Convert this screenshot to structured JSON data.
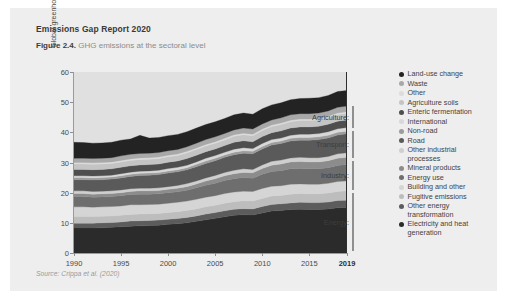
{
  "card": {
    "report_title": "Emissions Gap Report 2020",
    "figure_number": "Figure 2.4.",
    "figure_caption": "GHG emissions at the sectoral level",
    "source": "Source: Crippa et al. (2020)"
  },
  "chart_data": {
    "type": "area",
    "title": "GHG emissions at the sectoral level",
    "xlabel": "",
    "ylabel": "Global greenhouse gas emissions (GtCO₂e)",
    "xlim": [
      1990,
      2019
    ],
    "ylim": [
      0,
      60
    ],
    "ytick_labels": [
      "0",
      "10",
      "20",
      "30",
      "40",
      "50",
      "60"
    ],
    "ytick_values": [
      0,
      10,
      20,
      30,
      40,
      50,
      60
    ],
    "xtick_labels": [
      "1990",
      "1995",
      "2000",
      "2005",
      "2010",
      "2015",
      "2019"
    ],
    "xtick_values": [
      1990,
      1995,
      2000,
      2005,
      2010,
      2015,
      2019
    ],
    "xtick_bold": [
      "2019"
    ],
    "grid": false,
    "legend_position": "right",
    "stack_order_bottom_to_top": [
      "Electricity and heat generation",
      "Other energy transformation",
      "Fugitive emissions",
      "Building and other",
      "Energy use",
      "Mineral products",
      "Other industrial processes",
      "Road",
      "Non-road",
      "International",
      "Enteric fermentation",
      "Agriculture soils",
      "Other",
      "Waste",
      "Land-use change"
    ],
    "x": [
      1990,
      1991,
      1992,
      1993,
      1994,
      1995,
      1996,
      1997,
      1998,
      1999,
      2000,
      2001,
      2002,
      2003,
      2004,
      2005,
      2006,
      2007,
      2008,
      2009,
      2010,
      2011,
      2012,
      2013,
      2014,
      2015,
      2016,
      2017,
      2018,
      2019
    ],
    "series": [
      {
        "name": "Electricity and heat generation",
        "color": "#2b2b2b",
        "values": [
          8.3,
          8.3,
          8.3,
          8.4,
          8.5,
          8.7,
          8.9,
          9.0,
          9.1,
          9.2,
          9.5,
          9.7,
          10.0,
          10.5,
          11.0,
          11.5,
          12.0,
          12.5,
          12.7,
          12.6,
          13.3,
          13.9,
          14.1,
          14.4,
          14.5,
          14.4,
          14.4,
          14.6,
          15.0,
          15.1
        ]
      },
      {
        "name": "Other energy transformation",
        "color": "#5c5c5c",
        "values": [
          1.6,
          1.6,
          1.6,
          1.6,
          1.6,
          1.6,
          1.7,
          1.7,
          1.7,
          1.7,
          1.7,
          1.7,
          1.8,
          1.8,
          1.9,
          1.9,
          2.0,
          2.0,
          2.0,
          2.0,
          2.1,
          2.2,
          2.2,
          2.2,
          2.3,
          2.3,
          2.3,
          2.3,
          2.4,
          2.4
        ]
      },
      {
        "name": "Fugitive emissions",
        "color": "#bdbdbd",
        "values": [
          2.2,
          2.2,
          2.2,
          2.2,
          2.2,
          2.2,
          2.2,
          2.2,
          2.2,
          2.2,
          2.2,
          2.3,
          2.3,
          2.3,
          2.4,
          2.4,
          2.5,
          2.5,
          2.6,
          2.6,
          2.7,
          2.8,
          2.8,
          2.9,
          2.9,
          2.9,
          2.9,
          3.0,
          3.0,
          3.1
        ]
      },
      {
        "name": "Building and other",
        "color": "#d5d5d5",
        "values": [
          3.2,
          3.2,
          3.1,
          3.1,
          3.1,
          3.1,
          3.2,
          3.1,
          3.1,
          3.1,
          3.1,
          3.1,
          3.1,
          3.2,
          3.2,
          3.2,
          3.2,
          3.2,
          3.2,
          3.2,
          3.3,
          3.2,
          3.2,
          3.3,
          3.2,
          3.2,
          3.2,
          3.2,
          3.3,
          3.3
        ]
      },
      {
        "name": "Energy use",
        "color": "#6e6e6e",
        "values": [
          3.4,
          3.4,
          3.3,
          3.3,
          3.3,
          3.4,
          3.4,
          3.5,
          3.4,
          3.4,
          3.5,
          3.5,
          3.6,
          3.8,
          4.0,
          4.1,
          4.3,
          4.4,
          4.5,
          4.4,
          4.7,
          4.9,
          5.0,
          5.1,
          5.1,
          5.1,
          5.1,
          5.2,
          5.3,
          5.4
        ]
      },
      {
        "name": "Mineral products",
        "color": "#8c8c8c",
        "values": [
          1.0,
          1.0,
          1.0,
          1.0,
          1.0,
          1.0,
          1.0,
          1.1,
          1.1,
          1.1,
          1.1,
          1.2,
          1.2,
          1.3,
          1.4,
          1.5,
          1.6,
          1.7,
          1.7,
          1.8,
          1.9,
          2.1,
          2.2,
          2.3,
          2.3,
          2.3,
          2.3,
          2.3,
          2.4,
          2.4
        ]
      },
      {
        "name": "Other industrial processes",
        "color": "#cfcfcf",
        "values": [
          0.9,
          0.9,
          0.9,
          0.9,
          0.9,
          0.9,
          0.9,
          0.9,
          0.9,
          0.9,
          0.9,
          0.9,
          1.0,
          1.0,
          1.0,
          1.1,
          1.1,
          1.1,
          1.2,
          1.1,
          1.2,
          1.3,
          1.3,
          1.3,
          1.4,
          1.4,
          1.4,
          1.4,
          1.5,
          1.5
        ]
      },
      {
        "name": "Road",
        "color": "#5a5a5a",
        "values": [
          3.7,
          3.7,
          3.8,
          3.8,
          3.9,
          4.0,
          4.1,
          4.2,
          4.3,
          4.4,
          4.5,
          4.5,
          4.6,
          4.7,
          4.8,
          4.9,
          5.0,
          5.2,
          5.2,
          5.2,
          5.3,
          5.4,
          5.5,
          5.6,
          5.7,
          5.8,
          6.0,
          6.1,
          6.2,
          6.3
        ]
      },
      {
        "name": "Non-road",
        "color": "#9c9c9c",
        "values": [
          0.7,
          0.7,
          0.7,
          0.7,
          0.7,
          0.7,
          0.7,
          0.7,
          0.7,
          0.7,
          0.7,
          0.7,
          0.7,
          0.8,
          0.8,
          0.8,
          0.8,
          0.8,
          0.8,
          0.8,
          0.8,
          0.8,
          0.8,
          0.9,
          0.9,
          0.9,
          0.9,
          0.9,
          0.9,
          0.9
        ]
      },
      {
        "name": "International",
        "color": "#d8d8d8",
        "values": [
          0.6,
          0.6,
          0.6,
          0.6,
          0.6,
          0.7,
          0.7,
          0.7,
          0.7,
          0.7,
          0.8,
          0.8,
          0.8,
          0.8,
          0.9,
          0.9,
          0.9,
          1.0,
          1.0,
          0.9,
          1.0,
          1.0,
          1.0,
          1.0,
          1.1,
          1.1,
          1.1,
          1.2,
          1.2,
          1.2
        ]
      },
      {
        "name": "Enteric fermentation",
        "color": "#4e4e4e",
        "values": [
          2.1,
          2.1,
          2.1,
          2.1,
          2.1,
          2.1,
          2.1,
          2.1,
          2.1,
          2.1,
          2.1,
          2.1,
          2.2,
          2.2,
          2.2,
          2.2,
          2.2,
          2.3,
          2.3,
          2.3,
          2.3,
          2.3,
          2.4,
          2.4,
          2.4,
          2.4,
          2.4,
          2.5,
          2.5,
          2.5
        ]
      },
      {
        "name": "Agriculture soils",
        "color": "#c4c4c4",
        "values": [
          1.8,
          1.8,
          1.8,
          1.8,
          1.8,
          1.8,
          1.8,
          1.8,
          1.8,
          1.8,
          1.8,
          1.8,
          1.9,
          1.9,
          1.9,
          1.9,
          1.9,
          2.0,
          2.0,
          2.0,
          2.0,
          2.0,
          2.1,
          2.1,
          2.1,
          2.1,
          2.1,
          2.1,
          2.2,
          2.2
        ]
      },
      {
        "name": "Other",
        "color": "#dcdcdc",
        "values": [
          0.5,
          0.5,
          0.5,
          0.5,
          0.5,
          0.5,
          0.5,
          0.5,
          0.5,
          0.5,
          0.5,
          0.5,
          0.5,
          0.5,
          0.5,
          0.5,
          0.5,
          0.5,
          0.5,
          0.5,
          0.5,
          0.5,
          0.5,
          0.5,
          0.5,
          0.5,
          0.5,
          0.5,
          0.5,
          0.5
        ]
      },
      {
        "name": "Waste",
        "color": "#a8a8a8",
        "values": [
          1.4,
          1.4,
          1.4,
          1.4,
          1.4,
          1.5,
          1.5,
          1.5,
          1.5,
          1.5,
          1.5,
          1.5,
          1.5,
          1.6,
          1.6,
          1.6,
          1.6,
          1.6,
          1.7,
          1.7,
          1.7,
          1.7,
          1.7,
          1.8,
          1.8,
          1.8,
          1.8,
          1.8,
          1.9,
          1.9
        ]
      },
      {
        "name": "Land-use change",
        "color": "#232323",
        "values": [
          5.3,
          5.2,
          5.1,
          5.1,
          5.1,
          5.2,
          5.1,
          6.0,
          5.0,
          5.0,
          5.0,
          5.0,
          5.0,
          5.0,
          5.0,
          5.0,
          5.0,
          5.0,
          5.0,
          4.9,
          5.0,
          5.0,
          5.0,
          5.0,
          5.0,
          5.1,
          5.1,
          5.1,
          5.2,
          5.2
        ]
      }
    ]
  },
  "legend": {
    "items": [
      {
        "label": "Land-use change",
        "color": "#232323"
      },
      {
        "label": "Waste",
        "color": "#a8a8a8"
      },
      {
        "label": "Other",
        "color": "#dcdcdc"
      },
      {
        "label": "Agriculture soils",
        "color": "#c4c4c4"
      },
      {
        "label": "Enteric fermentation",
        "color": "#4e4e4e"
      },
      {
        "label": "International",
        "color": "#d8d8d8"
      },
      {
        "label": "Non-road",
        "color": "#9c9c9c"
      },
      {
        "label": "Road",
        "color": "#5a5a5a"
      },
      {
        "label": "Other industrial\nprocesses",
        "color": "#cfcfcf"
      },
      {
        "label": "Mineral products",
        "color": "#8c8c8c"
      },
      {
        "label": "Energy use",
        "color": "#6e6e6e"
      },
      {
        "label": "Building and other",
        "color": "#d5d5d5"
      },
      {
        "label": "Fugitive emissions",
        "color": "#bdbdbd"
      },
      {
        "label": "Other energy\ntransformation",
        "color": "#5c5c5c"
      },
      {
        "label": "Electricity and heat\ngeneration",
        "color": "#2b2b2b"
      }
    ]
  },
  "sector_brackets": [
    {
      "label": "Agriculture:",
      "top_pct": 19.0,
      "height_pct": 12.0
    },
    {
      "label": "Transport:",
      "top_pct": 32.5,
      "height_pct": 15.0
    },
    {
      "label": "Industry:",
      "top_pct": 49.0,
      "height_pct": 16.0
    },
    {
      "label": "Energy:",
      "top_pct": 67.0,
      "height_pct": 32.0
    }
  ]
}
